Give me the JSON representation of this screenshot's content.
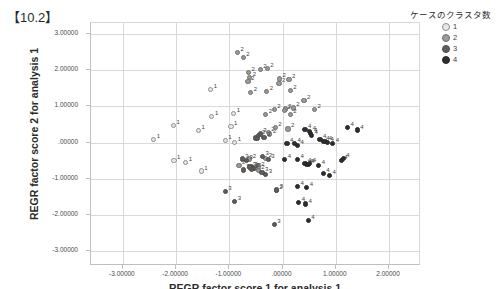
{
  "title": "【10.2】",
  "axes": {
    "y_title": "REGR factor score  2 for analysis 1",
    "x_title": "REGR factor score  1 for analysis 1",
    "y_ticks": [
      "3.00000",
      "2.00000",
      "1.00000",
      ".00000",
      "-1.00000",
      "-2.00000",
      "-3.00000"
    ],
    "x_ticks": [
      "-3.00000",
      "-2.00000",
      "-1.00000",
      ".00000",
      "1.00000",
      "2.00000"
    ]
  },
  "legend": {
    "title": "ケースのクラスタ数",
    "items": [
      {
        "label": "1",
        "color": "#e8e8e8",
        "stroke": "#8d8d8d"
      },
      {
        "label": "2",
        "color": "#9a9a9a",
        "stroke": "#6e6e6e"
      },
      {
        "label": "3",
        "color": "#5e5e5e",
        "stroke": "#4a4a4a"
      },
      {
        "label": "4",
        "color": "#2e2e2e",
        "stroke": "#262626"
      }
    ]
  },
  "chart_data": {
    "type": "scatter",
    "title": "【10.2】",
    "xlabel": "REGR factor score  1 for analysis 1",
    "ylabel": "REGR factor score  2 for analysis 1",
    "xlim": [
      -3.6,
      2.6
    ],
    "ylim": [
      -3.4,
      3.3
    ],
    "grid": true,
    "legend_position": "right",
    "legend_title": "ケースのクラスタ数",
    "point_labels": true,
    "series": [
      {
        "name": "1",
        "color": "#e8e8e8",
        "stroke": "#8d8d8d",
        "points": [
          [
            -2.4,
            0.05
          ],
          [
            -2.03,
            0.44
          ],
          [
            -2.02,
            -0.52
          ],
          [
            -1.8,
            -0.57
          ],
          [
            -1.56,
            0.3
          ],
          [
            -1.51,
            -0.81
          ],
          [
            -1.33,
            1.43
          ],
          [
            -1.31,
            0.69
          ],
          [
            -1.06,
            0.03
          ],
          [
            -0.95,
            0.42
          ],
          [
            -0.9,
            0.77
          ],
          [
            -0.88,
            -0.02
          ]
        ]
      },
      {
        "name": "2",
        "color": "#9a9a9a",
        "stroke": "#6e6e6e",
        "points": [
          [
            -0.83,
            2.46
          ],
          [
            -0.72,
            2.32
          ],
          [
            -0.62,
            1.9
          ],
          [
            -0.63,
            1.66
          ],
          [
            -0.6,
            1.78
          ],
          [
            -0.58,
            1.36
          ],
          [
            -0.4,
            2.0
          ],
          [
            -0.27,
            2.02
          ],
          [
            -0.28,
            1.39
          ],
          [
            -0.3,
            0.74
          ],
          [
            -0.22,
            0.21
          ],
          [
            -0.25,
            0.25
          ],
          [
            -0.14,
            0.88
          ],
          [
            -0.04,
            1.73
          ],
          [
            -0.05,
            1.61
          ],
          [
            0.14,
            1.72
          ],
          [
            0.16,
            1.4
          ],
          [
            0.07,
            0.9
          ],
          [
            0.05,
            0.86
          ],
          [
            0.22,
            0.93
          ],
          [
            -0.12,
            0.4
          ],
          [
            0.12,
            0.35
          ],
          [
            0.42,
            1.13
          ],
          [
            0.62,
            0.88
          ],
          [
            -0.54,
            -0.73
          ],
          [
            -0.5,
            -0.74
          ],
          [
            -0.44,
            -0.7
          ],
          [
            -0.3,
            -0.47
          ],
          [
            -0.1,
            -1.34
          ],
          [
            -0.44,
            -0.79
          ],
          [
            -0.6,
            -0.48
          ],
          [
            0.16,
            0.75
          ],
          [
            -0.8,
            -0.65
          ]
        ]
      },
      {
        "name": "3",
        "color": "#5e5e5e",
        "stroke": "#4a4a4a",
        "points": [
          [
            -0.74,
            -0.48
          ],
          [
            -0.72,
            -0.78
          ],
          [
            -0.49,
            0.1
          ],
          [
            -0.46,
            0.09
          ],
          [
            -0.43,
            0.18
          ],
          [
            -0.4,
            0.22
          ],
          [
            -0.36,
            -0.41
          ],
          [
            -0.37,
            -0.85
          ],
          [
            -0.3,
            -0.9
          ],
          [
            -1.06,
            -1.38
          ],
          [
            -0.88,
            -1.66
          ],
          [
            -0.14,
            -2.28
          ],
          [
            -0.57,
            -0.7
          ],
          [
            -0.53,
            -0.73
          ],
          [
            -0.56,
            -0.76
          ],
          [
            -0.6,
            -0.7
          ],
          [
            -0.25,
            -0.5
          ],
          [
            -0.66,
            -0.53
          ],
          [
            -0.09,
            -1.33
          ],
          [
            -0.33,
            0.12
          ]
        ]
      },
      {
        "name": "4",
        "color": "#2e2e2e",
        "stroke": "#262626",
        "points": [
          [
            0.1,
            -0.05
          ],
          [
            0.06,
            -0.5
          ],
          [
            0.3,
            -0.1
          ],
          [
            0.3,
            -0.49
          ],
          [
            0.44,
            0.34
          ],
          [
            0.53,
            0.29
          ],
          [
            0.55,
            0.23
          ],
          [
            0.56,
            0.16
          ],
          [
            0.72,
            0.07
          ],
          [
            0.78,
            0.0
          ],
          [
            0.83,
            0.0
          ],
          [
            0.86,
            -0.02
          ],
          [
            0.7,
            -0.66
          ],
          [
            0.78,
            -0.88
          ],
          [
            0.9,
            -0.93
          ],
          [
            0.96,
            -0.06
          ],
          [
            1.12,
            -0.52
          ],
          [
            1.16,
            -0.46
          ],
          [
            1.24,
            0.39
          ],
          [
            1.42,
            0.32
          ],
          [
            0.3,
            -1.24
          ],
          [
            0.47,
            -1.27
          ],
          [
            0.32,
            -1.68
          ],
          [
            0.45,
            -1.72
          ],
          [
            0.5,
            -2.17
          ],
          [
            0.44,
            -0.6
          ],
          [
            0.47,
            -0.62
          ],
          [
            0.5,
            -0.63
          ],
          [
            0.53,
            -0.61
          ],
          [
            0.24,
            -0.04
          ]
        ]
      }
    ]
  }
}
